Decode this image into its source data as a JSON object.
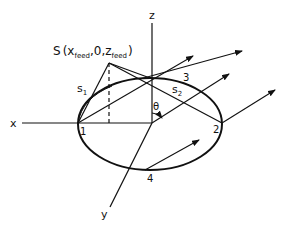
{
  "diagram": {
    "axes": {
      "x_label": "x",
      "y_label": "y",
      "z_label": "z"
    },
    "source": {
      "label_prefix": "S",
      "open_paren": "(",
      "x_var": "x",
      "x_sub": "feed",
      "mid": ",0,",
      "z_var": "z",
      "z_sub": "feed",
      "close_paren": ")"
    },
    "path_labels": {
      "s1_var": "s",
      "s1_sub": "1",
      "s2_var": "s",
      "s2_sub": "2"
    },
    "angle_label": "θ",
    "points": [
      "1",
      "2",
      "3",
      "4"
    ],
    "colors": {
      "stroke": "#111111",
      "background": "#ffffff"
    }
  }
}
